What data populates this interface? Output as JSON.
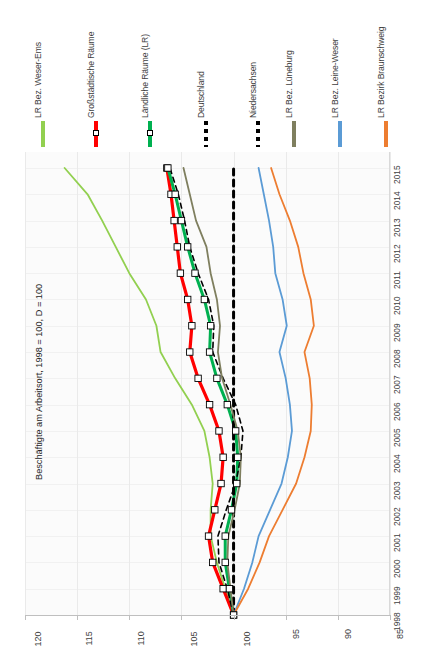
{
  "chart_data": {
    "type": "line",
    "title": "",
    "axis_title": "Beschäftigte am Arbeitsort, 1998 = 100, D = 100",
    "orientation": "rotated-90",
    "xlabel": "",
    "ylabel": "Beschäftigte am Arbeitsort, 1998 = 100, D = 100",
    "grid": true,
    "legend_position": "top",
    "value_axis": {
      "ticks": [
        120,
        115,
        110,
        105,
        100,
        95,
        90,
        85
      ],
      "min": 85,
      "max": 120,
      "reversed": true
    },
    "categories": [
      1998,
      1999,
      2000,
      2001,
      2002,
      2003,
      2004,
      2005,
      2006,
      2007,
      2008,
      2009,
      2010,
      2011,
      2012,
      2013,
      2014,
      2015
    ],
    "series": [
      {
        "name": "LR Bez. Weser-Ems",
        "color": "#92D050",
        "style": "solid",
        "width": 1.8,
        "marker": "none",
        "values": [
          100,
          100.8,
          101.6,
          102.2,
          102.2,
          102.0,
          102.3,
          102.8,
          104.0,
          105.6,
          107.0,
          107.4,
          108.4,
          110.0,
          111.3,
          112.6,
          114.0,
          116.2
        ]
      },
      {
        "name": "Großstädtische Räume",
        "color": "#FF0000",
        "style": "solid",
        "width": 3.2,
        "marker": "square",
        "values": [
          100,
          101.0,
          102.0,
          102.4,
          101.8,
          101.2,
          101.0,
          101.4,
          102.3,
          103.4,
          104.2,
          104.0,
          104.4,
          105.1,
          105.4,
          105.7,
          106.0,
          106.4
        ]
      },
      {
        "name": "Ländliche Räume (LR)",
        "color": "#00B050",
        "style": "solid",
        "width": 3.0,
        "marker": "square",
        "values": [
          100,
          100.4,
          100.8,
          100.8,
          100.2,
          99.7,
          99.6,
          99.8,
          100.6,
          101.6,
          102.3,
          102.2,
          102.8,
          103.7,
          104.4,
          105.0,
          105.6,
          106.3
        ]
      },
      {
        "name": "Deutschland",
        "color": "#000000",
        "style": "dashed",
        "width": 1.6,
        "marker": "none",
        "values": [
          100,
          100.6,
          101.4,
          101.5,
          100.7,
          99.8,
          99.3,
          99.1,
          99.8,
          101.0,
          102.0,
          101.9,
          102.4,
          103.4,
          104.2,
          104.7,
          105.3,
          106.1
        ]
      },
      {
        "name": "Niedersachsen",
        "color": "#000000",
        "style": "dashed-thick",
        "width": 3.0,
        "marker": "none",
        "values": [
          100,
          100,
          100,
          100,
          100,
          100,
          100,
          100,
          100,
          100,
          100,
          100,
          100,
          100,
          100,
          100,
          100,
          100
        ]
      },
      {
        "name": "LR Bez. Lüneburg",
        "color": "#7F7F5F",
        "style": "solid",
        "width": 1.8,
        "marker": "none",
        "values": [
          100,
          100.3,
          100.6,
          100.5,
          99.9,
          99.4,
          99.3,
          99.6,
          100.3,
          101.1,
          101.5,
          101.3,
          101.6,
          102.2,
          102.6,
          103.6,
          104.2,
          104.8
        ]
      },
      {
        "name": "LR Bez. Leine-Weser",
        "color": "#5B9BD5",
        "style": "solid",
        "width": 1.8,
        "marker": "none",
        "values": [
          100,
          99.0,
          98.2,
          97.6,
          96.5,
          95.4,
          94.8,
          94.4,
          94.6,
          95.0,
          95.6,
          94.9,
          95.3,
          96.0,
          96.2,
          96.6,
          97.1,
          97.6
        ]
      },
      {
        "name": "LR Bezirk Braunschweig",
        "color": "#ED7D31",
        "style": "solid",
        "width": 1.8,
        "marker": "none",
        "values": [
          100,
          98.6,
          97.5,
          96.6,
          95.3,
          94.0,
          93.2,
          92.6,
          92.5,
          92.7,
          93.2,
          92.3,
          92.6,
          93.3,
          93.8,
          94.6,
          95.6,
          96.4
        ]
      }
    ]
  },
  "legend": {
    "items": [
      {
        "label": "LR Bez. Weser-Ems",
        "color": "#92D050",
        "style": "solid",
        "marker": "none"
      },
      {
        "label": "Großstädtische Räume",
        "color": "#FF0000",
        "style": "solid",
        "marker": "square"
      },
      {
        "label": "Ländliche Räume (LR)",
        "color": "#00B050",
        "style": "solid",
        "marker": "square"
      },
      {
        "label": "Deutschland",
        "color": "#000000",
        "style": "dashed",
        "marker": "none"
      },
      {
        "label": "Niedersachsen",
        "color": "#000000",
        "style": "dashed",
        "marker": "none"
      },
      {
        "label": "LR Bez. Lüneburg",
        "color": "#7F7F5F",
        "style": "solid",
        "marker": "none"
      },
      {
        "label": "LR Bez. Leine-Weser",
        "color": "#5B9BD5",
        "style": "solid",
        "marker": "none"
      },
      {
        "label": "LR Bezirk Braunschweig",
        "color": "#ED7D31",
        "style": "solid",
        "marker": "none"
      }
    ]
  },
  "value_axis_labels": [
    "120",
    "115",
    "110",
    "105",
    "100",
    "95",
    "90",
    "85"
  ],
  "year_axis_labels": [
    "1998",
    "1999",
    "2000",
    "2001",
    "2002",
    "2003",
    "2004",
    "2005",
    "2006",
    "2007",
    "2008",
    "2009",
    "2010",
    "2011",
    "2012",
    "2013",
    "2014",
    "2015"
  ],
  "axis_title": "Beschäftigte am Arbeitsort, 1998 = 100, D = 100"
}
